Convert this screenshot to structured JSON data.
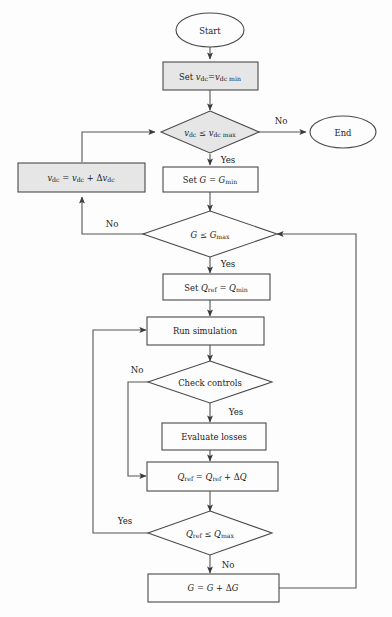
{
  "diagram": {
    "colors": {
      "background": "#fdfdfd",
      "node_fill_white": "#fdfdfd",
      "node_fill_gray": "#e6e6e6",
      "stroke": "#4a4a4a",
      "edge": "#555555",
      "text": "#1a1a1a"
    },
    "nodes": {
      "start": {
        "label": "Start",
        "shape": "ellipse",
        "fill": "white"
      },
      "end": {
        "label": "End",
        "shape": "ellipse",
        "fill": "white"
      },
      "set_vdc": {
        "label": "Set v_dc=v_dc min",
        "shape": "process",
        "fill": "gray"
      },
      "check_vdc": {
        "label": "v_dc ≤ v_dc max",
        "shape": "decision",
        "fill": "gray"
      },
      "inc_vdc": {
        "label": "v_dc = v_dc + Δv_dc",
        "shape": "process",
        "fill": "gray"
      },
      "set_g": {
        "label": "Set G = G_min",
        "shape": "process",
        "fill": "white"
      },
      "check_g": {
        "label": "G ≤ G_max",
        "shape": "decision",
        "fill": "white"
      },
      "set_qref": {
        "label": "Set Q_ref = Q_min",
        "shape": "process",
        "fill": "white"
      },
      "run_sim": {
        "label": "Run simulation",
        "shape": "process",
        "fill": "white"
      },
      "check_controls": {
        "label": "Check controls",
        "shape": "decision",
        "fill": "white"
      },
      "eval_losses": {
        "label": "Evaluate losses",
        "shape": "process",
        "fill": "white"
      },
      "inc_qref": {
        "label": "Q_ref = Q_ref + ΔQ",
        "shape": "process",
        "fill": "white"
      },
      "check_qref": {
        "label": "Q_ref ≤ Q_max",
        "shape": "decision",
        "fill": "white"
      },
      "inc_g": {
        "label": "G = G + ΔG",
        "shape": "process",
        "fill": "white"
      }
    },
    "edge_labels": {
      "vdc_no": "No",
      "vdc_yes": "Yes",
      "g_no": "No",
      "g_yes": "Yes",
      "controls_no": "No",
      "controls_yes": "Yes",
      "qref_yes": "Yes",
      "qref_no": "No"
    }
  }
}
